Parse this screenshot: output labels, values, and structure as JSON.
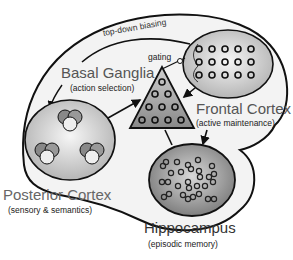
{
  "diagram": {
    "regions": {
      "basal_ganglia": {
        "name": "Basal Ganglia",
        "role": "(action selection)"
      },
      "frontal_cortex": {
        "name": "Frontal Cortex",
        "role": "(active maintenance)"
      },
      "posterior_cortex": {
        "name": "Posterior Cortex",
        "role": "(sensory & semantics)"
      },
      "hippocampus": {
        "name": "Hippocampus",
        "role": "(episodic memory)"
      }
    },
    "annotations": {
      "top_down": "top-down biasing",
      "gating": "gating"
    },
    "colors": {
      "outline": "#111111",
      "envelope_fill": "#f2f2f2",
      "region_fill_light": "#e8e8e8",
      "region_fill_dark": "#8a8a8a",
      "title_text": "#555555"
    }
  }
}
